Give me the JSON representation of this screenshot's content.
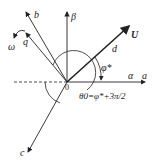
{
  "diagram": {
    "type": "vector-phasor-diagram",
    "origin_label": "0",
    "axes": {
      "alpha": "α",
      "beta": "β"
    },
    "phase_axes": {
      "a": "a",
      "b": "b",
      "c": "c"
    },
    "rotating_axes": {
      "d": "d",
      "q": "q"
    },
    "vector": "U",
    "rotation": "ω",
    "angle_label": "φ*",
    "angle_sub": "*",
    "theta_label": "θ0=φ*+3π/2"
  }
}
